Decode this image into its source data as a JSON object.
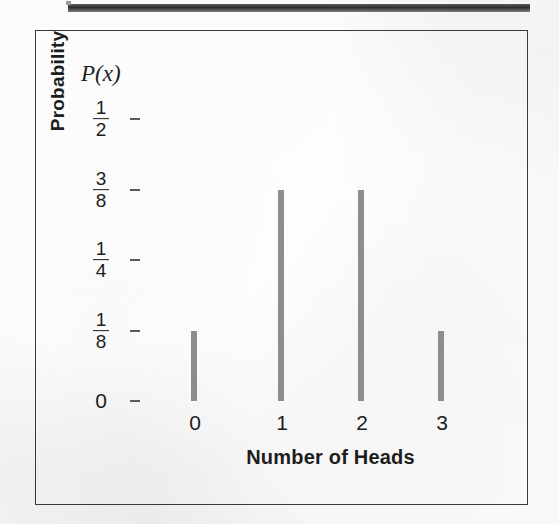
{
  "figure": {
    "y_series_label": "P(x)",
    "y_axis_title": "Probability",
    "x_axis_title": "Number of Heads"
  },
  "chart_data": {
    "type": "bar",
    "title": "",
    "subtitle": "",
    "xlabel": "Number of Heads",
    "ylabel": "Probability",
    "series_label": "P(x)",
    "categories": [
      "0",
      "1",
      "2",
      "3"
    ],
    "values": [
      0.125,
      0.375,
      0.375,
      0.125
    ],
    "value_labels": [
      "1/8",
      "3/8",
      "3/8",
      "1/8"
    ],
    "ylim": [
      0,
      0.5
    ],
    "xlim": [
      -0.5,
      3.8
    ],
    "grid": false,
    "legend": "none",
    "bar_color": "#8d8d8d",
    "axis_color": "#5a5a5a",
    "y_ticks": [
      {
        "value": 0.5,
        "label_num": "1",
        "label_den": "2",
        "is_fraction": true
      },
      {
        "value": 0.375,
        "label_num": "3",
        "label_den": "8",
        "is_fraction": true
      },
      {
        "value": 0.25,
        "label_num": "1",
        "label_den": "4",
        "is_fraction": true
      },
      {
        "value": 0.125,
        "label_num": "1",
        "label_den": "8",
        "is_fraction": true
      },
      {
        "value": 0.0,
        "label": "0",
        "is_fraction": false
      }
    ],
    "x_ticks": [
      {
        "value": 0,
        "label": "0"
      },
      {
        "value": 1,
        "label": "1"
      },
      {
        "value": 2,
        "label": "2"
      },
      {
        "value": 3,
        "label": "3"
      }
    ]
  },
  "geometry": {
    "y_axis_x_px": 102,
    "y_top_px": 88,
    "y_zero_px": 370,
    "x_axis_right_px": 487,
    "x_positions_px": [
      158,
      245,
      325,
      405
    ]
  },
  "colors": {
    "page_background": "#f2f2f2",
    "frame_border": "#3a3a3a",
    "bar": "#8d8d8d",
    "axis": "#5a5a5a",
    "text": "#1d1d1d",
    "top_bleed_bar": "#2f2f2f"
  }
}
